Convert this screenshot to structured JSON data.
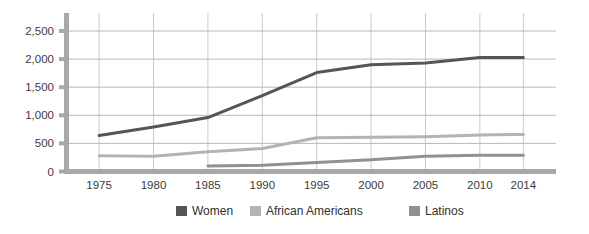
{
  "chart_data": {
    "type": "line",
    "title": "",
    "subtitle": "",
    "xlabel": "",
    "ylabel": "",
    "categories": [
      "1975",
      "1980",
      "1985",
      "1990",
      "1995",
      "2000",
      "2005",
      "2010",
      "2014"
    ],
    "x": [
      1975,
      1980,
      1985,
      1990,
      1995,
      2000,
      2005,
      2010,
      2014
    ],
    "ylim": [
      0,
      2500
    ],
    "xlim": [
      1972,
      2017
    ],
    "yticks": [
      0,
      500,
      1000,
      1500,
      2000,
      2500
    ],
    "ytick_labels": [
      "0",
      "500",
      "1,000",
      "1,500",
      "2,000",
      "2,500"
    ],
    "xtick_labels": [
      "1975",
      "1980",
      "1985",
      "1990",
      "1995",
      "2000",
      "2005",
      "2010",
      "2014"
    ],
    "grid": "horizontal-and-vertical",
    "legend_position": "bottom",
    "series": [
      {
        "name": "Women",
        "color": "#555555",
        "values": [
          640,
          790,
          960,
          1350,
          1760,
          1900,
          1930,
          2030,
          2030
        ]
      },
      {
        "name": "African Americans",
        "color": "#b3b3b3",
        "values": [
          280,
          270,
          350,
          410,
          600,
          610,
          620,
          650,
          660
        ]
      },
      {
        "name": "Latinos",
        "color": "#919191",
        "values": [
          null,
          null,
          100,
          110,
          160,
          210,
          270,
          290,
          290
        ]
      }
    ]
  },
  "legend": {
    "items": [
      {
        "label": "Women",
        "color": "#555555"
      },
      {
        "label": "African Americans",
        "color": "#b3b3b3"
      },
      {
        "label": "Latinos",
        "color": "#919191"
      }
    ]
  },
  "axes": {
    "y_labels": [
      "2,500",
      "2,000",
      "1,500",
      "1,000",
      "500",
      "0"
    ],
    "x_labels": [
      "1975",
      "1980",
      "1985",
      "1990",
      "1995",
      "2000",
      "2005",
      "2010",
      "2014"
    ]
  },
  "colors": {
    "background": "#ffffff",
    "axis": "#a8a8a8",
    "gridline_h": "#9b9b9b",
    "gridline_v": "#bdbdbd",
    "text": "#3b3b3b",
    "women": "#555555",
    "african_americans": "#b3b3b3",
    "latinos": "#919191"
  }
}
